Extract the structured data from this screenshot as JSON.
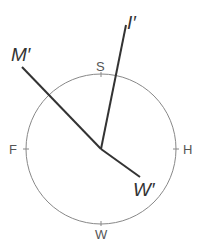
{
  "diagram": {
    "circle": {
      "cx": 101,
      "cy": 149,
      "r": 75,
      "stroke": "#888888"
    },
    "directions": [
      {
        "label": "S",
        "position": "top",
        "x": 97,
        "y": 71
      },
      {
        "label": "F",
        "position": "left",
        "x": 9,
        "y": 154
      },
      {
        "label": "H",
        "position": "right",
        "x": 183,
        "y": 154
      },
      {
        "label": "W",
        "position": "bottom",
        "x": 95,
        "y": 239
      }
    ],
    "vectors": [
      {
        "label": "M′",
        "x1": 101,
        "y1": 149,
        "x2": 22,
        "y2": 67,
        "label_x": 11,
        "label_y": 61
      },
      {
        "label": "I′",
        "x1": 101,
        "y1": 149,
        "x2": 126,
        "y2": 25,
        "label_x": 123,
        "label_y": 29
      },
      {
        "label": "W′",
        "x1": 101,
        "y1": 149,
        "x2": 140,
        "y2": 177,
        "label_x": 131,
        "label_y": 196
      }
    ],
    "line_color": "#333333"
  }
}
